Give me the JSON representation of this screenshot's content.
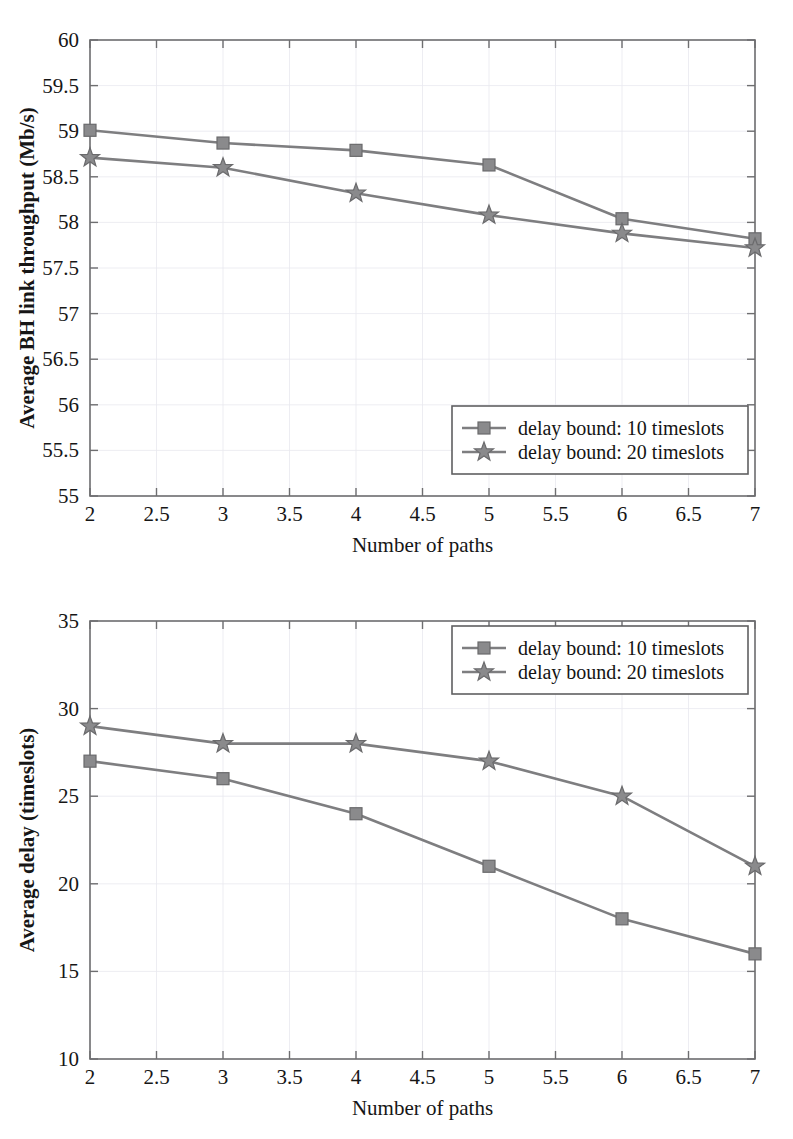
{
  "figures": [
    {
      "id": "throughput",
      "name": "average-bh-link-throughput-chart",
      "xlabel": "Number of paths",
      "ylabel": "Average BH link throughput (Mb/s)",
      "xticks": [
        "2",
        "2.5",
        "3",
        "3.5",
        "4",
        "4.5",
        "5",
        "5.5",
        "6",
        "6.5",
        "7"
      ],
      "yticks": [
        "55",
        "55.5",
        "56",
        "56.5",
        "57",
        "57.5",
        "58",
        "58.5",
        "59",
        "59.5",
        "60"
      ],
      "legend": {
        "position": "lower-right",
        "entries": [
          {
            "label": "delay bound: 10 timeslots",
            "marker": "square"
          },
          {
            "label": "delay bound: 20 timeslots",
            "marker": "star"
          }
        ]
      }
    },
    {
      "id": "delay",
      "name": "average-delay-chart",
      "xlabel": "Number of paths",
      "ylabel": "Average delay (timeslots)",
      "xticks": [
        "2",
        "2.5",
        "3",
        "3.5",
        "4",
        "4.5",
        "5",
        "5.5",
        "6",
        "6.5",
        "7"
      ],
      "yticks": [
        "10",
        "15",
        "20",
        "25",
        "30",
        "35"
      ],
      "legend": {
        "position": "upper-right",
        "entries": [
          {
            "label": "delay bound: 10 timeslots",
            "marker": "square"
          },
          {
            "label": "delay bound: 20 timeslots",
            "marker": "star"
          }
        ]
      }
    }
  ],
  "chart_data": [
    {
      "type": "line",
      "id": "throughput",
      "title": "",
      "xlabel": "Number of paths",
      "ylabel": "Average BH link throughput (Mb/s)",
      "x": [
        2,
        3,
        4,
        5,
        6,
        7
      ],
      "xlim": [
        2,
        7
      ],
      "ylim": [
        55,
        60
      ],
      "xtick_values": [
        2,
        2.5,
        3,
        3.5,
        4,
        4.5,
        5,
        5.5,
        6,
        6.5,
        7
      ],
      "ytick_values": [
        55,
        55.5,
        56,
        56.5,
        57,
        57.5,
        58,
        58.5,
        59,
        59.5,
        60
      ],
      "grid": false,
      "legend_position": "lower right",
      "series": [
        {
          "name": "delay bound: 10 timeslots",
          "marker": "square",
          "color": "#808082",
          "values": [
            59.01,
            58.87,
            58.79,
            58.63,
            58.04,
            57.82
          ]
        },
        {
          "name": "delay bound: 20 timeslots",
          "marker": "star",
          "color": "#808082",
          "values": [
            58.71,
            58.6,
            58.32,
            58.08,
            57.88,
            57.72
          ]
        }
      ]
    },
    {
      "type": "line",
      "id": "delay",
      "title": "",
      "xlabel": "Number of paths",
      "ylabel": "Average delay (timeslots)",
      "x": [
        2,
        3,
        4,
        5,
        6,
        7
      ],
      "xlim": [
        2,
        7
      ],
      "ylim": [
        10,
        35
      ],
      "xtick_values": [
        2,
        2.5,
        3,
        3.5,
        4,
        4.5,
        5,
        5.5,
        6,
        6.5,
        7
      ],
      "ytick_values": [
        10,
        15,
        20,
        25,
        30,
        35
      ],
      "grid": false,
      "legend_position": "upper right",
      "series": [
        {
          "name": "delay bound: 10 timeslots",
          "marker": "square",
          "color": "#808082",
          "values": [
            27,
            26,
            24,
            21,
            18,
            16
          ]
        },
        {
          "name": "delay bound: 20 timeslots",
          "marker": "star",
          "color": "#808082",
          "values": [
            29,
            28,
            28,
            27,
            25,
            21
          ]
        }
      ]
    }
  ],
  "colors": {
    "line": "#808082",
    "marker_fill": "#8a8a8c",
    "axis": "#6e6e70",
    "text": "#161616",
    "background": "#ffffff"
  }
}
